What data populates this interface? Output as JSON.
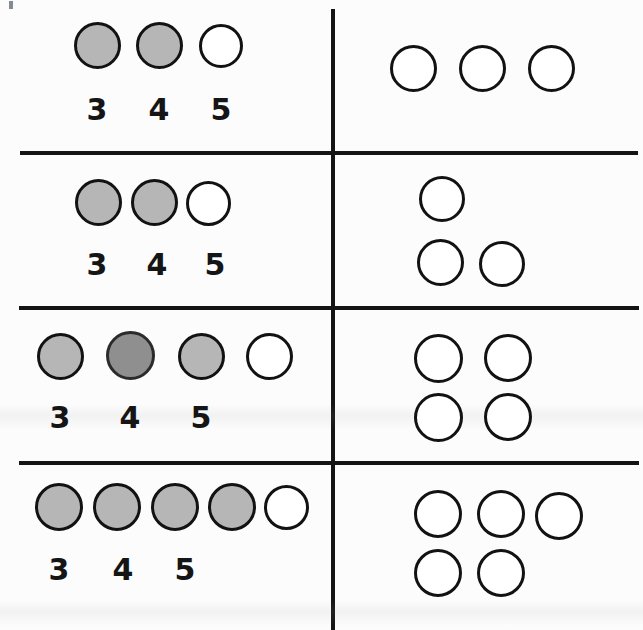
{
  "sheet": {
    "width": 643,
    "height": 630,
    "background_color": "#fcfcfc",
    "ink_color": "#141414",
    "fill_gray": "#b6b6b6",
    "fill_gray_dark": "#8f8f8f",
    "open_fill": "#ffffff"
  },
  "layout": {
    "divider_vertical_x": 332,
    "divider_horizontals_y": [
      152,
      307,
      462
    ],
    "left_column_label": "",
    "right_column_label": ""
  },
  "rows": [
    {
      "id": "row-1",
      "left": {
        "total_circles": 3,
        "filled_count": 2,
        "open_count": 1,
        "arrangement": "single-row",
        "circles": [
          {
            "state": "filled",
            "shade": "gray"
          },
          {
            "state": "filled",
            "shade": "gray"
          },
          {
            "state": "open",
            "shade": "white"
          }
        ],
        "numerals": [
          "3",
          "4",
          "5"
        ]
      },
      "right": {
        "total_circles": 3,
        "arrangement": "1x3",
        "rows": [
          3
        ],
        "circles": [
          {
            "state": "open"
          },
          {
            "state": "open"
          },
          {
            "state": "open"
          }
        ]
      }
    },
    {
      "id": "row-2",
      "left": {
        "total_circles": 3,
        "filled_count": 2,
        "open_count": 1,
        "arrangement": "single-row",
        "circles": [
          {
            "state": "filled",
            "shade": "gray"
          },
          {
            "state": "filled",
            "shade": "gray"
          },
          {
            "state": "open",
            "shade": "white"
          }
        ],
        "numerals": [
          "3",
          "4",
          "5"
        ]
      },
      "right": {
        "total_circles": 3,
        "arrangement": "1-over-2",
        "rows": [
          1,
          2
        ],
        "circles": [
          {
            "state": "open"
          },
          {
            "state": "open"
          },
          {
            "state": "open"
          }
        ]
      }
    },
    {
      "id": "row-3",
      "left": {
        "total_circles": 4,
        "filled_count": 3,
        "open_count": 1,
        "arrangement": "single-row",
        "circles": [
          {
            "state": "filled",
            "shade": "gray"
          },
          {
            "state": "filled",
            "shade": "dark-gray"
          },
          {
            "state": "filled",
            "shade": "gray"
          },
          {
            "state": "open",
            "shade": "white"
          }
        ],
        "numerals": [
          "3",
          "4",
          "5"
        ]
      },
      "right": {
        "total_circles": 4,
        "arrangement": "2x2",
        "rows": [
          2,
          2
        ],
        "circles": [
          {
            "state": "open"
          },
          {
            "state": "open"
          },
          {
            "state": "open"
          },
          {
            "state": "open"
          }
        ]
      }
    },
    {
      "id": "row-4",
      "left": {
        "total_circles": 5,
        "filled_count": 4,
        "open_count": 1,
        "arrangement": "single-row",
        "circles": [
          {
            "state": "filled",
            "shade": "gray"
          },
          {
            "state": "filled",
            "shade": "gray"
          },
          {
            "state": "filled",
            "shade": "gray"
          },
          {
            "state": "filled",
            "shade": "gray"
          },
          {
            "state": "open",
            "shade": "white"
          }
        ],
        "numerals": [
          "3",
          "4",
          "5"
        ]
      },
      "right": {
        "total_circles": 5,
        "arrangement": "3-over-2",
        "rows": [
          3,
          2
        ],
        "circles": [
          {
            "state": "open"
          },
          {
            "state": "open"
          },
          {
            "state": "open"
          },
          {
            "state": "open"
          },
          {
            "state": "open"
          }
        ]
      }
    }
  ]
}
